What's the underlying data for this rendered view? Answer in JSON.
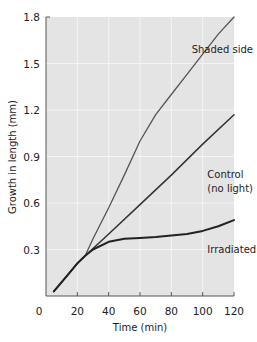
{
  "chart_data": {
    "type": "line",
    "title": "",
    "xlabel": "Time (min)",
    "ylabel": "Growth in length (mm)",
    "xlim": [
      0,
      120
    ],
    "ylim": [
      0,
      1.8
    ],
    "x_ticks": [
      0,
      20,
      40,
      60,
      80,
      100,
      120
    ],
    "y_ticks": [
      0.3,
      0.6,
      0.9,
      1.2,
      1.5,
      1.8
    ],
    "x_tick_labels": [
      "0",
      "20",
      "40",
      "60",
      "80",
      "100",
      "120"
    ],
    "y_tick_labels": [
      "0.3",
      "0.6",
      "0.9",
      "1.2",
      "1.5",
      "1.8"
    ],
    "grid": true,
    "legend": "inline annotations",
    "series": [
      {
        "name": "Shaded side",
        "color": "#555555",
        "x": [
          5,
          10,
          15,
          20,
          25,
          30,
          40,
          50,
          60,
          70,
          80,
          90,
          100,
          110,
          120
        ],
        "y": [
          0.03,
          0.09,
          0.15,
          0.21,
          0.26,
          0.37,
          0.57,
          0.78,
          1.0,
          1.17,
          1.3,
          1.43,
          1.56,
          1.69,
          1.8
        ]
      },
      {
        "name": "Control (no light)",
        "color": "#333333",
        "x": [
          5,
          10,
          15,
          20,
          25,
          40,
          60,
          80,
          100,
          120
        ],
        "y": [
          0.03,
          0.09,
          0.15,
          0.21,
          0.26,
          0.4,
          0.59,
          0.78,
          0.98,
          1.17
        ]
      },
      {
        "name": "Irradiated side",
        "color": "#222222",
        "x": [
          5,
          10,
          15,
          20,
          25,
          30,
          40,
          50,
          60,
          70,
          80,
          90,
          100,
          110,
          120
        ],
        "y": [
          0.03,
          0.09,
          0.15,
          0.21,
          0.26,
          0.3,
          0.35,
          0.37,
          0.375,
          0.38,
          0.39,
          0.4,
          0.42,
          0.45,
          0.49
        ]
      }
    ],
    "annotations": [
      {
        "text": "Shaded side",
        "x": 93,
        "y": 1.57
      },
      {
        "text": "Control",
        "x": 103,
        "y": 0.76
      },
      {
        "text": "(no light)",
        "x": 103,
        "y": 0.67
      },
      {
        "text": "Irradiated side",
        "x": 103,
        "y": 0.28
      }
    ],
    "colors": {
      "plot_background": "#e4e4e4",
      "gridline": "#f4f4f4",
      "axis": "#555555"
    }
  }
}
